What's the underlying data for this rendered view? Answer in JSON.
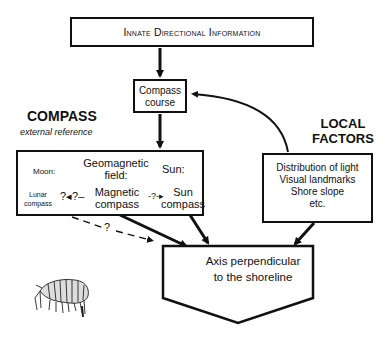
{
  "title": "Innate Directional Information",
  "compass_course": "Compass\ncourse",
  "compass_course_lines": [
    "Compass",
    "course"
  ],
  "compass_section": {
    "heading": "COMPASS",
    "subheading": "external reference",
    "moon_label": "Moon:",
    "geomagnetic_label_lines": [
      "Geomagnetic",
      "field:"
    ],
    "sun_label": "Sun:",
    "lunar_compass_lines": [
      "Lunar",
      "compass"
    ],
    "magnetic_compass_lines": [
      "Magnetic",
      "compass"
    ],
    "sun_compass_lines": [
      "Sun",
      "compass"
    ],
    "link_lunar_magnetic": "?◂?–",
    "link_magnetic_sun": "-?-▸",
    "link_dashed_label": "?"
  },
  "local_factors": {
    "heading_lines": [
      "LOCAL",
      "FACTORS"
    ],
    "items": [
      "Distribution of light",
      "Visual landmarks",
      "Shore slope",
      "etc."
    ]
  },
  "outcome": {
    "lines": [
      "Axis perpendicular",
      "to the shoreline"
    ]
  },
  "illustration": "amphipod (sandhopper) drawing",
  "colors": {
    "ink": "#111111",
    "background": "#ffffff"
  }
}
